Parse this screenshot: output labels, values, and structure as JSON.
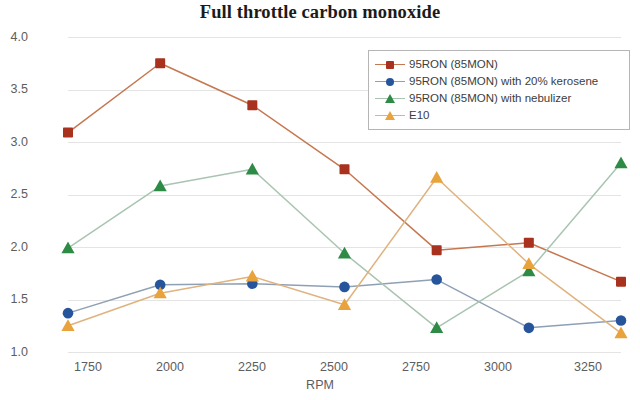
{
  "chart_data": {
    "type": "line",
    "title": "Full throttle carbon monoxide",
    "xlabel": "RPM",
    "ylabel": "CO % by volume",
    "x": [
      1750,
      2000,
      2250,
      2500,
      2750,
      3000,
      3250
    ],
    "categories": [
      "1750",
      "2000",
      "2250",
      "2500",
      "2750",
      "3000",
      "3250"
    ],
    "xlim": [
      1750,
      3250
    ],
    "ylim": [
      1.0,
      4.0
    ],
    "yticks": [
      1.0,
      1.5,
      2.0,
      2.5,
      3.0,
      3.5,
      4.0
    ],
    "ytick_labels": [
      "1.0",
      "1.5",
      "2.0",
      "2.5",
      "3.0",
      "3.5",
      "4.0"
    ],
    "grid": "horizontal",
    "legend_position": "top-right",
    "series": [
      {
        "name": "95RON (85MON)",
        "values": [
          3.09,
          3.75,
          3.35,
          2.74,
          1.97,
          2.04,
          1.67
        ],
        "marker": "square",
        "marker_color": "#a8321e",
        "line_color": "#c5774f"
      },
      {
        "name": "95RON (85MON) with 20% kerosene",
        "values": [
          1.37,
          1.64,
          1.65,
          1.62,
          1.69,
          1.23,
          1.3
        ],
        "marker": "circle",
        "marker_color": "#27559c",
        "line_color": "#8fa0b4"
      },
      {
        "name": "95RON (85MON) with nebulizer",
        "values": [
          1.99,
          2.58,
          2.74,
          1.94,
          1.23,
          1.77,
          2.8
        ],
        "marker": "triangle",
        "marker_color": "#2e8b45",
        "line_color": "#a9c4b2"
      },
      {
        "name": "E10",
        "values": [
          1.25,
          1.56,
          1.72,
          1.45,
          2.66,
          1.84,
          1.18
        ],
        "marker": "triangle",
        "marker_color": "#e8a33d",
        "line_color": "#e0b27e"
      }
    ]
  },
  "axes": {
    "y_ticks": [
      "4.0",
      "3.5",
      "3.0",
      "2.5",
      "2.0",
      "1.5",
      "1.0"
    ],
    "y_title": "CO % by volume",
    "x_ticks": [
      "1750",
      "2000",
      "2250",
      "2500",
      "2750",
      "3000",
      "3250"
    ],
    "x_title": "RPM"
  },
  "legend": {
    "items": [
      {
        "label": "95RON (85MON)"
      },
      {
        "label": "95RON (85MON) with 20% kerosene"
      },
      {
        "label": "95RON (85MON) with nebulizer"
      },
      {
        "label": "E10"
      }
    ]
  }
}
